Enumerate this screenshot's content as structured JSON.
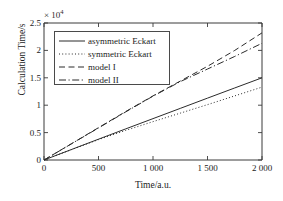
{
  "chart_data": {
    "type": "line",
    "title": "",
    "xlabel": "Time/a.u.",
    "ylabel": "Calculation Time/s",
    "y_exponent_label": "× 10",
    "y_exponent_power": "4",
    "y_scale_factor": 10000,
    "xlim": [
      0,
      2000
    ],
    "ylim": [
      0,
      25000
    ],
    "xticks": [
      0,
      500,
      1000,
      1500,
      2000
    ],
    "xtick_labels": [
      "0",
      "500",
      "1 000",
      "1 500",
      "2 000"
    ],
    "yticks": [
      0,
      5000,
      10000,
      15000,
      20000,
      25000
    ],
    "ytick_labels": [
      "0",
      "0.5",
      "1",
      "1.5",
      "2",
      "2.5"
    ],
    "grid": false,
    "legend_position": "upper left",
    "series": [
      {
        "name": "asymmetric Eckart",
        "style": "solid",
        "x": [
          0,
          250,
          500,
          750,
          1000,
          1250,
          1500,
          1750,
          2000
        ],
        "y": [
          0,
          1900,
          3800,
          5680,
          7550,
          9420,
          11290,
          13150,
          15000
        ]
      },
      {
        "name": "symmetric Eckart",
        "style": "dotted",
        "x": [
          0,
          250,
          500,
          750,
          1000,
          1250,
          1500,
          1750,
          2000
        ],
        "y": [
          0,
          1880,
          3720,
          5400,
          7000,
          8550,
          10100,
          11700,
          13300
        ]
      },
      {
        "name": "model I",
        "style": "dashed",
        "x": [
          0,
          250,
          500,
          750,
          1000,
          1250,
          1500,
          1750,
          2000
        ],
        "y": [
          0,
          2950,
          5900,
          8850,
          11700,
          14400,
          17100,
          20000,
          23200
        ]
      },
      {
        "name": "model II",
        "style": "dashdot",
        "x": [
          0,
          250,
          500,
          750,
          1000,
          1250,
          1500,
          1750,
          2000
        ],
        "y": [
          0,
          2930,
          5850,
          8780,
          11650,
          14300,
          16600,
          18900,
          21300
        ]
      }
    ]
  },
  "colors": {
    "axis": "#3a3a3a",
    "line": "#2b2b2b",
    "background": "#ffffff"
  }
}
